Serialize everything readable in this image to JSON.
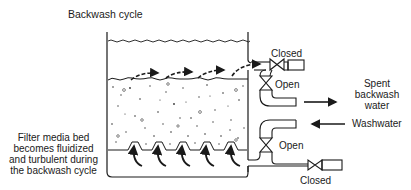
{
  "title": "Backwash cycle",
  "labels": {
    "top_valve": "Closed",
    "upper_open_valve": "Open",
    "spent_line1": "Spent",
    "spent_line2": "backwash",
    "spent_line3": "water",
    "washwater": "Washwater",
    "lower_open_valve": "Open",
    "bottom_valve": "Closed",
    "media_line1": "Filter media bed",
    "media_line2": "becomes fluidized",
    "media_line3": "and turbulent during",
    "media_line4": "the backwash cycle"
  },
  "colors": {
    "ink": "#1a1a1a",
    "background": "#ffffff"
  }
}
